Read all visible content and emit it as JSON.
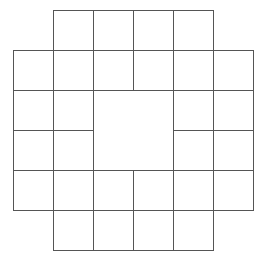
{
  "diagram": {
    "type": "grid-shape",
    "cell_size": 40,
    "origin": {
      "x": 13,
      "y": 10
    },
    "columns": 6,
    "rows": 6,
    "line_color": "#555555",
    "background": "#ffffff",
    "cells": [
      {
        "r": 0,
        "c": 1,
        "w": 1,
        "h": 1
      },
      {
        "r": 0,
        "c": 2,
        "w": 1,
        "h": 1
      },
      {
        "r": 0,
        "c": 3,
        "w": 1,
        "h": 1
      },
      {
        "r": 0,
        "c": 4,
        "w": 1,
        "h": 1
      },
      {
        "r": 1,
        "c": 0,
        "w": 1,
        "h": 1
      },
      {
        "r": 1,
        "c": 1,
        "w": 1,
        "h": 1
      },
      {
        "r": 1,
        "c": 2,
        "w": 1,
        "h": 1
      },
      {
        "r": 1,
        "c": 3,
        "w": 1,
        "h": 1
      },
      {
        "r": 1,
        "c": 4,
        "w": 1,
        "h": 1
      },
      {
        "r": 1,
        "c": 5,
        "w": 1,
        "h": 1
      },
      {
        "r": 2,
        "c": 0,
        "w": 1,
        "h": 1
      },
      {
        "r": 2,
        "c": 1,
        "w": 1,
        "h": 1
      },
      {
        "r": 2,
        "c": 2,
        "w": 2,
        "h": 2
      },
      {
        "r": 2,
        "c": 4,
        "w": 1,
        "h": 1
      },
      {
        "r": 2,
        "c": 5,
        "w": 1,
        "h": 1
      },
      {
        "r": 3,
        "c": 0,
        "w": 1,
        "h": 1
      },
      {
        "r": 3,
        "c": 1,
        "w": 1,
        "h": 1
      },
      {
        "r": 3,
        "c": 4,
        "w": 1,
        "h": 1
      },
      {
        "r": 3,
        "c": 5,
        "w": 1,
        "h": 1
      },
      {
        "r": 4,
        "c": 0,
        "w": 1,
        "h": 1
      },
      {
        "r": 4,
        "c": 1,
        "w": 1,
        "h": 1
      },
      {
        "r": 4,
        "c": 2,
        "w": 1,
        "h": 1
      },
      {
        "r": 4,
        "c": 3,
        "w": 1,
        "h": 1
      },
      {
        "r": 4,
        "c": 4,
        "w": 1,
        "h": 1
      },
      {
        "r": 4,
        "c": 5,
        "w": 1,
        "h": 1
      },
      {
        "r": 5,
        "c": 1,
        "w": 1,
        "h": 1
      },
      {
        "r": 5,
        "c": 2,
        "w": 1,
        "h": 1
      },
      {
        "r": 5,
        "c": 3,
        "w": 1,
        "h": 1
      },
      {
        "r": 5,
        "c": 4,
        "w": 1,
        "h": 1
      }
    ]
  }
}
